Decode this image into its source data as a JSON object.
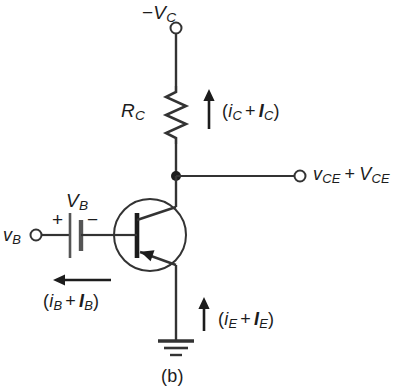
{
  "figure": {
    "caption": "(b)",
    "line_color": "#333333",
    "text_color": "#1c1c1c",
    "background": "#ffffff"
  },
  "labels": {
    "supply": {
      "sign": "−",
      "symbol": "V",
      "sub": "C"
    },
    "resistor": {
      "symbol": "R",
      "sub": "C"
    },
    "collector_current": {
      "open": "(",
      "ac": "i",
      "ac_sub": "C",
      "plus": "+",
      "dc": "I",
      "dc_sub": "C",
      "close": ")"
    },
    "output": {
      "ac": "v",
      "ac_sub": "CE",
      "plus": "+",
      "dc": "V",
      "dc_sub": "CE"
    },
    "base_source": {
      "symbol": "V",
      "sub": "B"
    },
    "battery_plus": "+",
    "battery_minus": "−",
    "base_input": {
      "symbol": "v",
      "sub": "B"
    },
    "base_current": {
      "open": "(",
      "ac": "i",
      "ac_sub": "B",
      "plus": "+",
      "dc": "I",
      "dc_sub": "B",
      "close": ")"
    },
    "emitter_current": {
      "open": "(",
      "ac": "i",
      "ac_sub": "E",
      "plus": "+",
      "dc": "I",
      "dc_sub": "E",
      "close": ")"
    }
  },
  "components": {
    "transistor_type": "pnp-bipolar-junction-transistor",
    "resistor_name": "collector-resistor",
    "ground_name": "earth-ground",
    "supply_terminal": "negative-supply-terminal",
    "output_terminal": "collector-emitter-output-terminal",
    "input_terminal": "base-input-terminal"
  }
}
